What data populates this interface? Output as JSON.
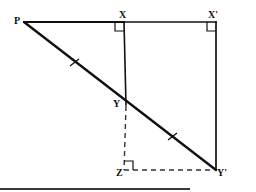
{
  "figure": {
    "background_color": "#ffffff",
    "stroke_color": "#111111",
    "dash_color": "#333333",
    "canvas": {
      "width": 256,
      "height": 192
    },
    "points": [
      {
        "id": "P",
        "label": "P",
        "x": 24,
        "y": 22
      },
      {
        "id": "X",
        "label": "X",
        "x": 124,
        "y": 22
      },
      {
        "id": "Xp",
        "label": "X'",
        "x": 216,
        "y": 22
      },
      {
        "id": "Y",
        "label": "Y",
        "x": 127,
        "y": 104
      },
      {
        "id": "Z",
        "label": "Z",
        "x": 124,
        "y": 170
      },
      {
        "id": "Yp",
        "label": "Y'",
        "x": 216,
        "y": 170
      }
    ],
    "segments": [
      {
        "id": "PX",
        "from": "P",
        "to": "X",
        "style": "solid",
        "width": 2.0
      },
      {
        "id": "XXp",
        "from": "X",
        "to": "Xp",
        "style": "solid",
        "width": 1.6
      },
      {
        "id": "XY",
        "from": "X",
        "to": "Y",
        "style": "solid",
        "width": 1.6
      },
      {
        "id": "XpYp",
        "from": "Xp",
        "to": "Yp",
        "style": "solid",
        "width": 1.6
      },
      {
        "id": "PYp",
        "from": "P",
        "to": "Yp",
        "style": "solid",
        "width": 2.4
      },
      {
        "id": "YZ",
        "from": "Y",
        "to": "Z",
        "style": "dashed",
        "width": 1.4
      },
      {
        "id": "ZYp",
        "from": "Z",
        "to": "Yp",
        "style": "dashed",
        "width": 1.4
      }
    ],
    "right_angles": [
      {
        "id": "angle-at-X",
        "at": "X",
        "size": 9
      },
      {
        "id": "angle-at-Xp",
        "at": "Xp",
        "size": 9
      },
      {
        "id": "angle-at-Z",
        "at": "Z",
        "size": 9
      }
    ],
    "tick_marks": [
      {
        "id": "tick-PY",
        "on": "PY",
        "x": 74,
        "y": 63,
        "count": 1
      },
      {
        "id": "tick-YYp",
        "on": "YYp",
        "x": 172,
        "y": 137,
        "count": 1
      }
    ]
  }
}
